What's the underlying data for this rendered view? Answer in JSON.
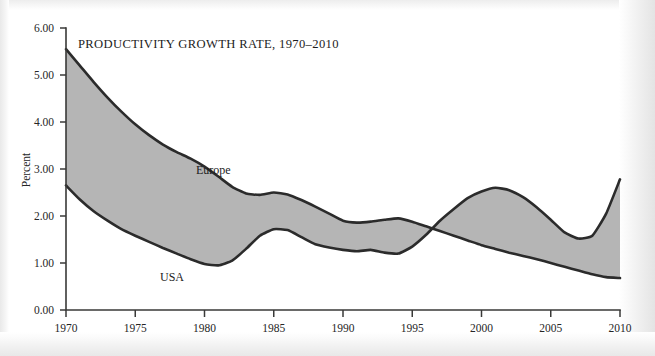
{
  "figure": {
    "title": "PRODUCTIVITY GROWTH RATE, 1970–2010",
    "ylabel": "Percent"
  },
  "labels": {
    "europe": "Europe",
    "usa": "USA"
  },
  "axes": {
    "y_ticks": [
      "0.00",
      "1.00",
      "2.00",
      "3.00",
      "4.00",
      "5.00",
      "6.00"
    ],
    "x_ticks": [
      "1970",
      "1975",
      "1980",
      "1985",
      "1990",
      "1995",
      "2000",
      "2005",
      "2010"
    ]
  },
  "colors": {
    "band_fill": "#b5b5b5",
    "line": "#2b2b2b",
    "axis": "#3a3a38",
    "background": "#ffffff"
  },
  "chart_data": {
    "type": "area",
    "title": "PRODUCTIVITY GROWTH RATE, 1970–2010",
    "xlabel": "",
    "ylabel": "Percent",
    "xlim": [
      1970,
      2010
    ],
    "ylim": [
      0.0,
      6.0
    ],
    "ytick_values": [
      0,
      1,
      2,
      3,
      4,
      5,
      6
    ],
    "xtick_values": [
      1970,
      1975,
      1980,
      1985,
      1990,
      1995,
      2000,
      2005,
      2010
    ],
    "grid": false,
    "legend": "inline-annotations",
    "annotations": [
      {
        "text": "Europe",
        "x": 1984.6,
        "y": 3.05
      },
      {
        "text": "USA",
        "x": 1981.2,
        "y": 0.62
      }
    ],
    "x": [
      1970,
      1971,
      1972,
      1973,
      1974,
      1975,
      1976,
      1977,
      1978,
      1979,
      1980,
      1981,
      1982,
      1983,
      1984,
      1985,
      1986,
      1987,
      1988,
      1989,
      1990,
      1991,
      1992,
      1993,
      1994,
      1995,
      1996,
      1997,
      1998,
      1999,
      2000,
      2001,
      2002,
      2003,
      2004,
      2005,
      2006,
      2007,
      2008,
      2009,
      2010
    ],
    "series": [
      {
        "name": "Europe",
        "values": [
          5.55,
          5.2,
          4.85,
          4.52,
          4.22,
          3.95,
          3.72,
          3.52,
          3.36,
          3.22,
          3.05,
          2.84,
          2.62,
          2.48,
          2.45,
          2.5,
          2.46,
          2.34,
          2.2,
          2.05,
          1.9,
          1.86,
          1.88,
          1.92,
          1.95,
          1.88,
          1.78,
          1.68,
          1.58,
          1.48,
          1.38,
          1.3,
          1.22,
          1.15,
          1.08,
          1.0,
          0.92,
          0.84,
          0.76,
          0.7,
          0.68
        ]
      },
      {
        "name": "USA",
        "values": [
          2.65,
          2.35,
          2.1,
          1.9,
          1.72,
          1.58,
          1.45,
          1.32,
          1.2,
          1.08,
          0.98,
          0.95,
          1.05,
          1.3,
          1.58,
          1.72,
          1.7,
          1.55,
          1.4,
          1.33,
          1.28,
          1.25,
          1.28,
          1.22,
          1.2,
          1.35,
          1.6,
          1.9,
          2.15,
          2.38,
          2.52,
          2.6,
          2.55,
          2.4,
          2.18,
          1.92,
          1.65,
          1.52,
          1.58,
          2.05,
          2.78
        ]
      }
    ]
  }
}
